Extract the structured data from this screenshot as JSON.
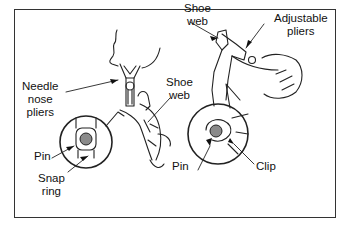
{
  "figure": {
    "left_panel": {
      "labels": {
        "needle_nose_pliers": [
          "Needle",
          "nose",
          "pliers"
        ],
        "shoe_web": [
          "Shoe",
          "web"
        ],
        "pin": "Pin",
        "snap_ring": [
          "Snap",
          "ring"
        ]
      }
    },
    "right_panel": {
      "labels": {
        "shoe_web": [
          "Shoe",
          "web"
        ],
        "adjustable_pliers": [
          "Adjustable",
          "pliers"
        ],
        "pin": "Pin",
        "clip": "Clip"
      }
    },
    "colors": {
      "line": "#222222",
      "pin_fill": "#8a8a8a",
      "frame": "#333333",
      "background": "#ffffff"
    }
  }
}
